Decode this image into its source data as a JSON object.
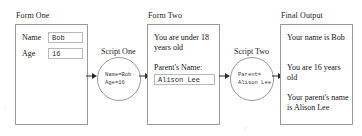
{
  "diagram": {
    "groups": {
      "form_one_label": "Form One",
      "form_two_label": "Form Two",
      "final_output_label": "Final Output"
    },
    "form_one": {
      "name_label": "Name",
      "name_value": "Bob",
      "age_label": "Age",
      "age_value": "16"
    },
    "script_one": {
      "title": "Script One",
      "line_1": "Name=Bob",
      "line_2": "Age=16"
    },
    "form_two": {
      "message": "You are under 18 years old",
      "parent_name_label": "Parent's Name:",
      "parent_name_value": "Alison Lee"
    },
    "script_two": {
      "title": "Script Two",
      "line_1": "Parent=",
      "line_2": "Alison Lee"
    },
    "final_output": {
      "line_1": "Your name is Bob",
      "line_2": "You are 16 years old",
      "line_3": "Your parent's name is Alison Lee"
    },
    "scan_marks": {
      "left": "/",
      "bottom": "/"
    },
    "colors": {
      "panel_border": "#9a9a9a",
      "input_border": "#b9b9b9",
      "arrow": "#2b2b2b",
      "text": "#141414",
      "mono_text": "#3a3a3a",
      "background": "#ffffff"
    }
  }
}
